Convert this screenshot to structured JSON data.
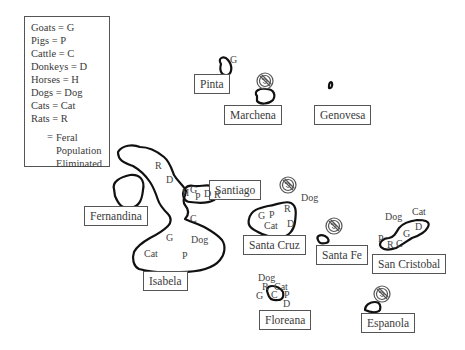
{
  "legend": {
    "items": [
      {
        "animal": "Goats",
        "code": "G",
        "text": "Goats = G"
      },
      {
        "animal": "Pigs",
        "code": "P",
        "text": "Pigs = P"
      },
      {
        "animal": "Cattle",
        "code": "C",
        "text": "Cattle = C"
      },
      {
        "animal": "Donkeys",
        "code": "D",
        "text": "Donkeys = D"
      },
      {
        "animal": "Horses",
        "code": "H",
        "text": "Horses = H"
      },
      {
        "animal": "Dogs",
        "code": "Dog",
        "text": "Dogs = Dog"
      },
      {
        "animal": "Cats",
        "code": "Cat",
        "text": "Cats = Cat"
      },
      {
        "animal": "Rats",
        "code": "R",
        "text": "Rats = R"
      }
    ],
    "symbol_eq": "=",
    "symbol_meaning_lines": [
      "Feral",
      "Population",
      "Eliminated"
    ],
    "symbol_icon": "prohibition-icon"
  },
  "islands": {
    "pinta": {
      "name": "Pinta",
      "animals": [
        "G"
      ],
      "eliminated": false
    },
    "marchena": {
      "name": "Marchena",
      "animals": [],
      "eliminated": true
    },
    "genovesa": {
      "name": "Genovesa",
      "animals": [],
      "eliminated": false
    },
    "santiago": {
      "name": "Santiago",
      "animals": [
        "G",
        "P",
        "D",
        "R"
      ],
      "eliminated": false
    },
    "fernandina": {
      "name": "Fernandina",
      "animals": [],
      "eliminated": false
    },
    "isabela": {
      "name": "Isabela",
      "animals": [
        "R",
        "D",
        "H",
        "C",
        "G",
        "Dog",
        "Cat",
        "P"
      ],
      "eliminated": false
    },
    "santa_cruz": {
      "name": "Santa Cruz",
      "animals": [
        "G",
        "P",
        "R",
        "Cat",
        "D",
        "Dog"
      ],
      "eliminated": true
    },
    "santa_fe": {
      "name": "Santa Fe",
      "animals": [],
      "eliminated": true
    },
    "san_cristobal": {
      "name": "San Cristobal",
      "animals": [
        "Dog",
        "Cat",
        "D",
        "G",
        "P",
        "R",
        "C"
      ],
      "eliminated": false
    },
    "floreana": {
      "name": "Floreana",
      "animals": [
        "Dog",
        "R",
        "Cat",
        "G",
        "C",
        "P",
        "D"
      ],
      "eliminated": false
    },
    "espanola": {
      "name": "Espanola",
      "animals": [],
      "eliminated": true
    }
  },
  "colors": {
    "outline": "#111111",
    "text": "#3a3a3a",
    "box_border": "#555555",
    "background": "#ffffff"
  }
}
